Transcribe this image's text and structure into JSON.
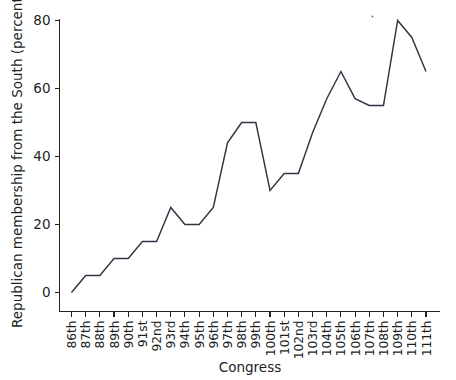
{
  "chart_data": {
    "type": "line",
    "title": "",
    "xlabel": "Congress",
    "ylabel": "Republican membership from the South (percent)",
    "categories": [
      "86th",
      "87th",
      "88th",
      "89th",
      "90th",
      "91st",
      "92nd",
      "93rd",
      "94th",
      "95th",
      "96th",
      "97th",
      "98th",
      "99th",
      "100th",
      "101st",
      "102nd",
      "103rd",
      "104th",
      "105th",
      "106th",
      "107th",
      "108th",
      "109th",
      "110th",
      "111th"
    ],
    "values": [
      0,
      5,
      5,
      10,
      10,
      15,
      15,
      25,
      20,
      20,
      25,
      44,
      50,
      50,
      30,
      35,
      35,
      47,
      57,
      65,
      57,
      55,
      55,
      80,
      75,
      65
    ],
    "ylim": [
      0,
      80
    ],
    "yticks": [
      0,
      20,
      40,
      60,
      80
    ],
    "ytick_labels": [
      "0",
      "20",
      "40",
      "60",
      "80"
    ],
    "grid": false,
    "legend": null,
    "series_color": "#333344",
    "axis_color": "#221f1f"
  },
  "figure": {
    "name": "republican-south-membership-line-chart"
  }
}
